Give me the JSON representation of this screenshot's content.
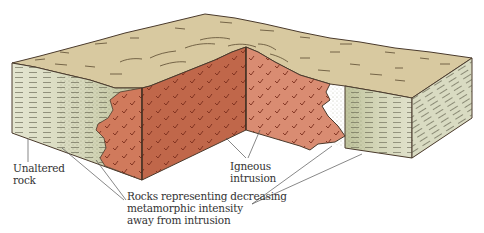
{
  "figure": {
    "colors": {
      "top_surface": "#d8c9a0",
      "unaltered_rock": "#e2e3cd",
      "metamorphic_zone": "#c9cca6",
      "intrusion_dark": "#c0674a",
      "intrusion_light": "#d98c72",
      "outline": "#4a3a2c",
      "leader_line": "#555555"
    }
  },
  "labels": {
    "unaltered_rock": [
      "Unaltered",
      "rock"
    ],
    "igneous_intrusion": [
      "Igneous",
      "intrusion"
    ],
    "metamorphic_gradient": [
      "Rocks representing decreasing",
      "metamorphic intensity",
      "away from intrusion"
    ]
  }
}
